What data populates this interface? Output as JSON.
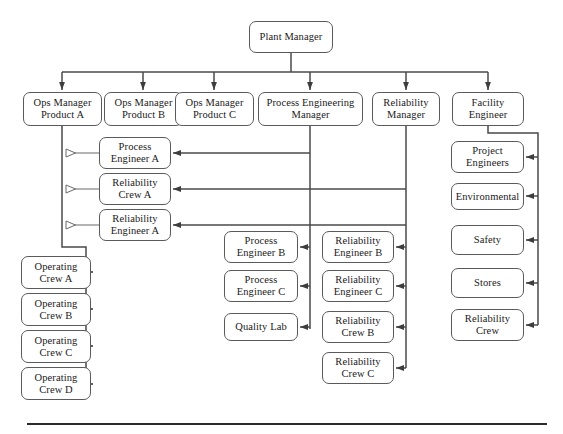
{
  "diagram": {
    "line_color": "#4a4a4a",
    "box_border_color": "#5a5a5a",
    "box_fill_color": "#ffffff",
    "rule_color": "#2b2b2b"
  },
  "nodes": {
    "plant_manager": {
      "label": "Plant Manager",
      "x": 249,
      "y": 21,
      "w": 84,
      "h": 32
    },
    "ops_manager_a": {
      "label": "Ops Manager\nProduct A",
      "x": 23,
      "y": 92,
      "w": 79,
      "h": 34
    },
    "ops_manager_b": {
      "label": "Ops Manager\nProduct B",
      "x": 104,
      "y": 92,
      "w": 79,
      "h": 34
    },
    "ops_manager_c": {
      "label": "Ops Manager\nProduct C",
      "x": 175,
      "y": 92,
      "w": 79,
      "h": 34
    },
    "process_engineering_manager": {
      "label": "Process Engineering\nManager",
      "x": 258,
      "y": 92,
      "w": 105,
      "h": 34
    },
    "reliability_manager": {
      "label": "Reliability\nManager",
      "x": 372,
      "y": 92,
      "w": 68,
      "h": 34
    },
    "facility_engineer": {
      "label": "Facility\nEngineer",
      "x": 452,
      "y": 92,
      "w": 72,
      "h": 34
    },
    "process_engineer_a": {
      "label": "Process\nEngineer A",
      "x": 99,
      "y": 137,
      "w": 72,
      "h": 32
    },
    "reliability_crew_a": {
      "label": "Reliability\nCrew A",
      "x": 99,
      "y": 173,
      "w": 72,
      "h": 32
    },
    "reliability_engineer_a": {
      "label": "Reliability\nEngineer A",
      "x": 99,
      "y": 209,
      "w": 72,
      "h": 32
    },
    "operating_crew_a": {
      "label": "Operating\nCrew A",
      "x": 21,
      "y": 256,
      "w": 70,
      "h": 33
    },
    "operating_crew_b": {
      "label": "Operating\nCrew B",
      "x": 21,
      "y": 293,
      "w": 70,
      "h": 33
    },
    "operating_crew_c": {
      "label": "Operating\nCrew C",
      "x": 21,
      "y": 330,
      "w": 70,
      "h": 33
    },
    "operating_crew_d": {
      "label": "Operating\nCrew D",
      "x": 21,
      "y": 367,
      "w": 70,
      "h": 33
    },
    "process_engineer_b": {
      "label": "Process\nEngineer B",
      "x": 224,
      "y": 231,
      "w": 74,
      "h": 32
    },
    "process_engineer_c": {
      "label": "Process\nEngineer C",
      "x": 224,
      "y": 270,
      "w": 74,
      "h": 32
    },
    "quality_lab": {
      "label": "Quality Lab",
      "x": 224,
      "y": 313,
      "w": 74,
      "h": 28
    },
    "reliability_engineer_b": {
      "label": "Reliability\nEngineer B",
      "x": 322,
      "y": 231,
      "w": 72,
      "h": 32
    },
    "reliability_engineer_c": {
      "label": "Reliability\nEngineer C",
      "x": 322,
      "y": 270,
      "w": 72,
      "h": 32
    },
    "reliability_crew_b": {
      "label": "Reliability\nCrew B",
      "x": 322,
      "y": 311,
      "w": 72,
      "h": 32
    },
    "reliability_crew_c": {
      "label": "Reliability\nCrew C",
      "x": 322,
      "y": 352,
      "w": 72,
      "h": 32
    },
    "project_engineers": {
      "label": "Project\nEngineers",
      "x": 451,
      "y": 141,
      "w": 73,
      "h": 32
    },
    "environmental": {
      "label": "Environmental",
      "x": 451,
      "y": 183,
      "w": 73,
      "h": 27
    },
    "safety": {
      "label": "Safety",
      "x": 451,
      "y": 225,
      "w": 73,
      "h": 30
    },
    "stores": {
      "label": "Stores",
      "x": 451,
      "y": 268,
      "w": 73,
      "h": 30
    },
    "reliability_crew_facility": {
      "label": "Reliability\nCrew",
      "x": 451,
      "y": 309,
      "w": 73,
      "h": 32
    }
  },
  "bottom_rule": {
    "x": 27,
    "y": 423,
    "w": 520,
    "h": 2
  }
}
